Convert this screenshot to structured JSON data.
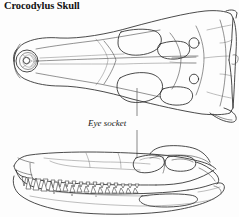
{
  "figure": {
    "title": "Crocodylus Skull",
    "background_color": "#fdfdfd",
    "line_color": "#2b2b2b",
    "text_color": "#111111"
  },
  "annotations": [
    {
      "id": "eye-socket",
      "label": "Eye socket",
      "style": "italic",
      "leader_line": "vertical",
      "points_to": [
        "dorsal-view-orbit",
        "lateral-view-orbit"
      ]
    }
  ],
  "views": [
    {
      "id": "dorsal-view",
      "name": "dorsal-skull-view",
      "orientation": "top",
      "features": [
        "snout",
        "external-naris",
        "orbit",
        "supratemporal-fenestra",
        "cranial-table",
        "quadratojugal",
        "squamosal"
      ]
    },
    {
      "id": "lateral-view",
      "name": "lateral-skull-view",
      "orientation": "side",
      "features": [
        "maxillary-teeth",
        "dentary-teeth",
        "orbit",
        "infratemporal-fenestra",
        "quadrate",
        "lower-jaw",
        "mandibular-fenestra"
      ]
    }
  ]
}
